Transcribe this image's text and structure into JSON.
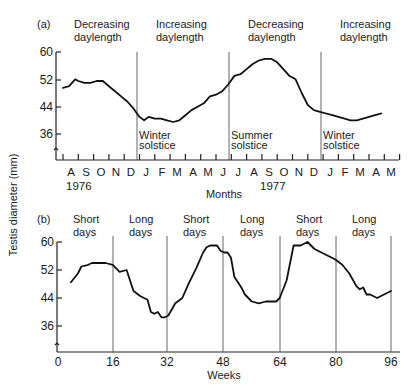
{
  "chart_data": [
    {
      "panel": "(a)",
      "type": "line",
      "title": "",
      "xlabel": "Months",
      "ylabel": "Testis diameter (mm)",
      "ylim": [
        30,
        60
      ],
      "yticks": [
        60,
        52,
        44,
        36
      ],
      "grid": false,
      "x_tick_labels": [
        "A",
        "S",
        "O",
        "N",
        "D",
        "J",
        "F",
        "M",
        "A",
        "M",
        "J",
        "J",
        "A",
        "S",
        "O",
        "N",
        "D",
        "J",
        "F",
        "M",
        "A",
        "M"
      ],
      "year_labels": [
        {
          "label": "1976",
          "under": "A"
        },
        {
          "label": "1977",
          "under": "S"
        }
      ],
      "period_labels": [
        {
          "line1": "Decreasing",
          "line2": "daylength"
        },
        {
          "line1": "Increasing",
          "line2": "daylength"
        },
        {
          "line1": "Decreasing",
          "line2": "daylength"
        },
        {
          "line1": "Increasing",
          "line2": "daylength"
        }
      ],
      "markers": [
        {
          "line1": "Winter",
          "line2": "solstice",
          "at": "Dec/Jan 1976-77"
        },
        {
          "line1": "Summer",
          "line2": "solstice",
          "at": "Jun/Jul 1977"
        },
        {
          "line1": "Winter",
          "line2": "solstice",
          "at": "Dec/Jan 1977-78"
        }
      ],
      "series": [
        {
          "name": "Testis diameter",
          "x_month_index": [
            0.0,
            0.4,
            0.8,
            1.0,
            1.4,
            1.8,
            2.2,
            2.6,
            3.0,
            3.4,
            3.8,
            4.2,
            4.6,
            5.0,
            5.3,
            5.6,
            6.0,
            6.4,
            6.8,
            7.2,
            7.6,
            8.0,
            8.4,
            8.8,
            9.2,
            9.6,
            10.0,
            10.4,
            10.8,
            11.2,
            11.6,
            12.0,
            12.4,
            12.8,
            13.2,
            13.6,
            14.0,
            14.4,
            14.8,
            15.2,
            15.6,
            16.0,
            16.4,
            16.8,
            17.2,
            17.6,
            18.0,
            18.4,
            18.8,
            19.2,
            19.6,
            20.0,
            20.4,
            20.8
          ],
          "values": [
            49.5,
            50,
            52,
            51.5,
            51,
            51,
            51.5,
            51.5,
            50,
            48.5,
            47,
            45.5,
            43.5,
            41,
            40,
            41,
            40.5,
            40.5,
            40,
            39.5,
            40,
            41.5,
            43,
            44,
            45,
            47,
            47.5,
            48.5,
            50.5,
            53,
            53.5,
            55,
            56.5,
            57.5,
            58,
            58,
            57,
            55,
            53,
            52,
            48,
            44.5,
            43,
            42.5,
            42,
            41.5,
            41,
            40.5,
            40,
            40,
            40.5,
            41,
            41.5,
            42
          ]
        }
      ]
    },
    {
      "panel": "(b)",
      "type": "line",
      "title": "",
      "xlabel": "Weeks",
      "ylabel": "Testis diameter (mm)",
      "ylim": [
        30,
        60
      ],
      "xlim": [
        0,
        96
      ],
      "xticks": [
        0,
        16,
        32,
        48,
        64,
        80,
        96
      ],
      "yticks": [
        60,
        52,
        44,
        36
      ],
      "grid": false,
      "period_labels": [
        {
          "line1": "Short",
          "line2": "days"
        },
        {
          "line1": "Long",
          "line2": "days"
        },
        {
          "line1": "Short",
          "line2": "days"
        },
        {
          "line1": "Long",
          "line2": "days"
        },
        {
          "line1": "Short",
          "line2": "days"
        },
        {
          "line1": "Long",
          "line2": "days"
        }
      ],
      "series": [
        {
          "name": "Testis diameter",
          "x": [
            4,
            6,
            7,
            9,
            10,
            12,
            14,
            16,
            18,
            20,
            22,
            24,
            26,
            27,
            28,
            29,
            30,
            31,
            32,
            34,
            36,
            38,
            40,
            42,
            43,
            44,
            46,
            47,
            48,
            49,
            50,
            51,
            53,
            54,
            56,
            58,
            60,
            62,
            63,
            64,
            66,
            67,
            68,
            70,
            72,
            74,
            76,
            78,
            80,
            82,
            84,
            86,
            87,
            88,
            89,
            90,
            92,
            94,
            96
          ],
          "values": [
            48.5,
            51,
            53,
            53.5,
            54,
            54,
            54,
            53.5,
            51.5,
            52,
            46,
            44.5,
            43.5,
            40,
            39.5,
            40,
            38.5,
            38.5,
            39,
            42.5,
            44,
            48.5,
            52.5,
            57,
            58.5,
            59,
            59,
            57.5,
            57,
            57,
            55.5,
            50,
            47,
            45,
            43,
            42.5,
            43,
            43,
            43,
            44,
            49,
            54,
            59,
            59,
            60,
            58,
            57,
            56,
            55,
            53.5,
            51,
            47.5,
            46.5,
            47,
            45,
            45,
            44,
            45,
            46
          ]
        }
      ]
    }
  ],
  "panel_a": {
    "label": "(a)",
    "periods": [
      {
        "l1": "Decreasing",
        "l2": "daylength"
      },
      {
        "l1": "Increasing",
        "l2": "daylength"
      },
      {
        "l1": "Decreasing",
        "l2": "daylength"
      },
      {
        "l1": "Increasing",
        "l2": "daylength"
      }
    ],
    "yticks": [
      "60",
      "52",
      "44",
      "36"
    ],
    "months": [
      "A",
      "S",
      "O",
      "N",
      "D",
      "J",
      "F",
      "M",
      "A",
      "M",
      "J",
      "J",
      "A",
      "S",
      "O",
      "N",
      "D",
      "J",
      "F",
      "M",
      "A",
      "M"
    ],
    "years": [
      "1976",
      "1977"
    ],
    "xlabel": "Months",
    "solstices": [
      {
        "l1": "Winter",
        "l2": "solstice"
      },
      {
        "l1": "Summer",
        "l2": "solstice"
      },
      {
        "l1": "Winter",
        "l2": "solstice"
      }
    ]
  },
  "panel_b": {
    "label": "(b)",
    "periods": [
      {
        "l1": "Short",
        "l2": "days"
      },
      {
        "l1": "Long",
        "l2": "days"
      },
      {
        "l1": "Short",
        "l2": "days"
      },
      {
        "l1": "Long",
        "l2": "days"
      },
      {
        "l1": "Short",
        "l2": "days"
      },
      {
        "l1": "Long",
        "l2": "days"
      }
    ],
    "yticks": [
      "60",
      "52",
      "44",
      "36"
    ],
    "xticks": [
      "0",
      "16",
      "32",
      "48",
      "64",
      "80",
      "96"
    ],
    "xlabel": "Weeks"
  },
  "ylabel": "Testis diameter (mm)"
}
